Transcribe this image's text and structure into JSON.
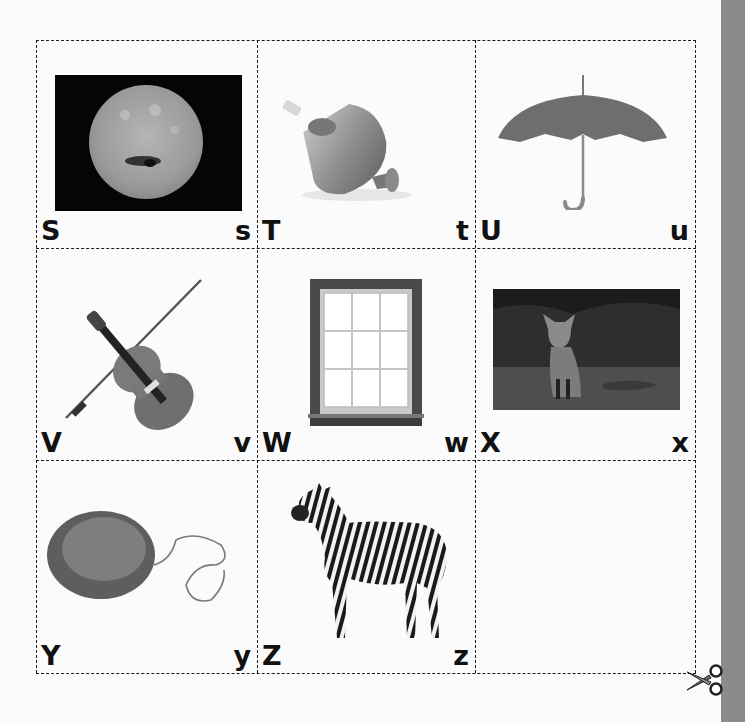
{
  "worksheet": {
    "cards": [
      {
        "upper": "S",
        "lower": "s",
        "picture": "sun"
      },
      {
        "upper": "T",
        "lower": "t",
        "picture": "spinning-top"
      },
      {
        "upper": "U",
        "lower": "u",
        "picture": "umbrella"
      },
      {
        "upper": "V",
        "lower": "v",
        "picture": "violin"
      },
      {
        "upper": "W",
        "lower": "w",
        "picture": "window"
      },
      {
        "upper": "X",
        "lower": "x",
        "picture": "fox"
      },
      {
        "upper": "Y",
        "lower": "y",
        "picture": "yo-yo"
      },
      {
        "upper": "Z",
        "lower": "z",
        "picture": "zebra"
      },
      {
        "upper": "",
        "lower": "",
        "picture": "empty"
      }
    ],
    "cut_icon": "scissors-icon",
    "colors": {
      "border": "#1a1a1a",
      "letter": "#111111",
      "sidebar": "#8b8b8b",
      "background": "#fbfbfb"
    }
  }
}
